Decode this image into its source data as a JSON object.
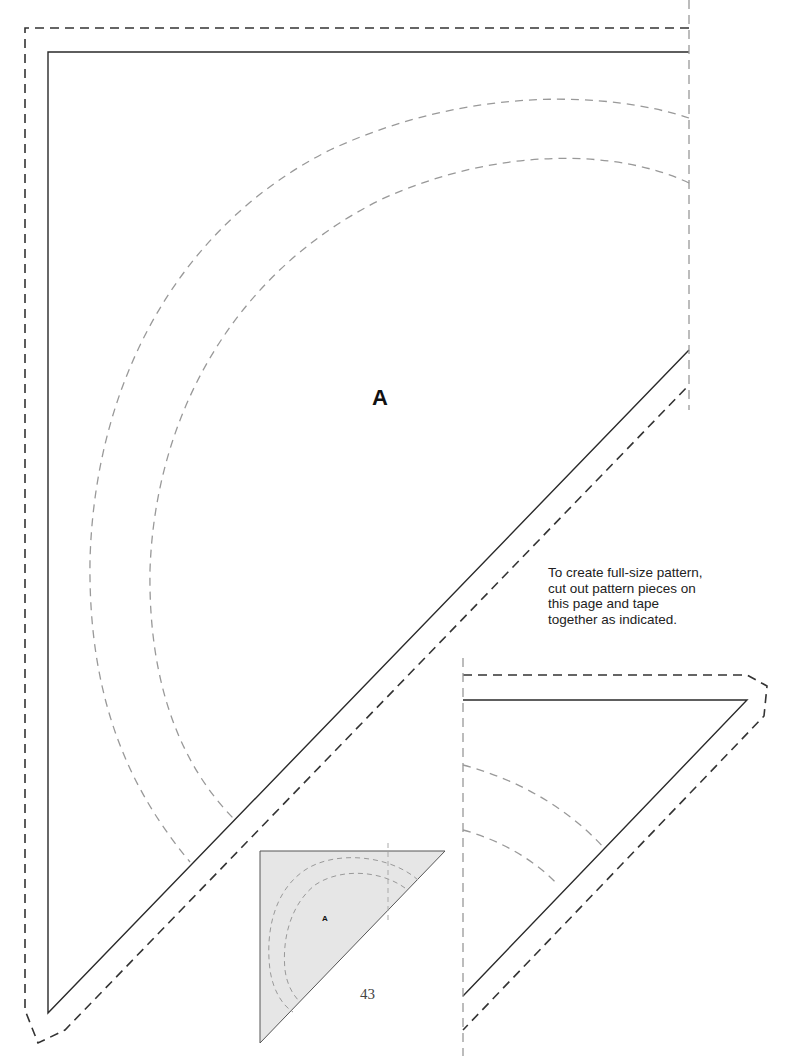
{
  "document": {
    "type": "sewing-pattern-page",
    "page_number": "43"
  },
  "main_piece": {
    "label": "A",
    "cut_line": "solid",
    "seam_allowance_line": "dashed",
    "placement_lines": [
      "outer-arc",
      "inner-arc"
    ],
    "join_line": "dashed-vertical"
  },
  "continuation_piece": {
    "label": "",
    "cut_line": "solid",
    "seam_allowance_line": "dashed",
    "placement_lines": [
      "outer-arc",
      "inner-arc"
    ]
  },
  "instructions": {
    "text": "To create full-size pattern, cut out pattern pieces on this page and tape together as indicated."
  },
  "thumbnail": {
    "label": "A",
    "fill_color": "#e6e6e6",
    "description": "assembled-pattern-preview"
  },
  "colors": {
    "cut_line": "#2a2a2a",
    "seam_line": "#333333",
    "guide_line": "#999999",
    "thumbnail_fill": "#e6e6e6"
  }
}
